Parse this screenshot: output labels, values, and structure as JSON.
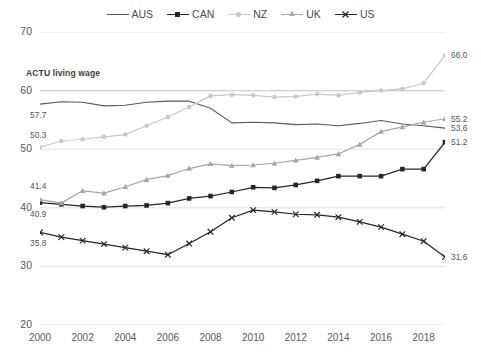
{
  "chart_data": {
    "type": "line",
    "title": "",
    "xlabel": "",
    "ylabel": "",
    "ylim": [
      20,
      70
    ],
    "xlim": [
      2000,
      2019
    ],
    "grid": true,
    "legend_position": "top-center",
    "ytick_labels": [
      "70",
      "60",
      "50",
      "40",
      "30",
      "20"
    ],
    "yticks": [
      70,
      60,
      50,
      40,
      30,
      20
    ],
    "xtick_labels": [
      "2000",
      "2002",
      "2004",
      "2006",
      "2008",
      "2010",
      "2012",
      "2014",
      "2016",
      "2018"
    ],
    "xticks": [
      2000,
      2002,
      2004,
      2006,
      2008,
      2010,
      2012,
      2014,
      2016,
      2018
    ],
    "x": [
      2000,
      2001,
      2002,
      2003,
      2004,
      2005,
      2006,
      2007,
      2008,
      2009,
      2010,
      2011,
      2012,
      2013,
      2014,
      2015,
      2016,
      2017,
      2018,
      2019
    ],
    "series": [
      {
        "name": "AUS",
        "color": "#595959",
        "marker": "none",
        "values": [
          57.7,
          58.1,
          58.0,
          57.4,
          57.5,
          58.0,
          58.2,
          58.2,
          57.0,
          54.5,
          54.6,
          54.5,
          54.2,
          54.3,
          54.0,
          54.4,
          54.9,
          54.3,
          54.0,
          53.6
        ]
      },
      {
        "name": "CAN",
        "color": "#262626",
        "marker": "square",
        "values": [
          40.9,
          40.6,
          40.3,
          40.1,
          40.3,
          40.4,
          40.8,
          41.6,
          42.0,
          42.7,
          43.5,
          43.4,
          43.9,
          44.6,
          45.4,
          45.4,
          45.4,
          46.6,
          46.6,
          51.2
        ]
      },
      {
        "name": "NZ",
        "color": "#c9c9c9",
        "marker": "circle",
        "values": [
          50.3,
          51.4,
          51.7,
          52.1,
          52.5,
          54.0,
          55.5,
          57.2,
          59.1,
          59.3,
          59.2,
          58.9,
          59.0,
          59.4,
          59.2,
          59.7,
          60.0,
          60.3,
          61.3,
          66.0
        ]
      },
      {
        "name": "UK",
        "color": "#a6a6a6",
        "marker": "triangle",
        "values": [
          41.4,
          40.8,
          42.9,
          42.5,
          43.6,
          44.8,
          45.5,
          46.7,
          47.5,
          47.2,
          47.3,
          47.6,
          48.1,
          48.6,
          49.2,
          50.8,
          53.0,
          53.8,
          54.6,
          55.2
        ]
      },
      {
        "name": "US",
        "color": "#262626",
        "marker": "x",
        "values": [
          35.8,
          35.0,
          34.4,
          33.8,
          33.2,
          32.6,
          32.0,
          33.9,
          35.9,
          38.3,
          39.6,
          39.3,
          38.9,
          38.8,
          38.4,
          37.6,
          36.7,
          35.5,
          34.3,
          31.6
        ]
      }
    ],
    "reference_lines": [
      {
        "label": "ACTU living wage",
        "value": 60,
        "color": "#cfcfcf"
      }
    ],
    "start_labels": [
      {
        "series": "AUS",
        "text": "57.7",
        "value": 57.7
      },
      {
        "series": "NZ",
        "text": "50.3",
        "value": 50.3
      },
      {
        "series": "UK",
        "text": "41.4",
        "value": 41.4
      },
      {
        "series": "CAN",
        "text": "40.9",
        "value": 40.9
      },
      {
        "series": "US",
        "text": "35.8",
        "value": 35.8
      }
    ],
    "end_labels": [
      {
        "series": "NZ",
        "text": "66.0",
        "value": 66.0
      },
      {
        "series": "UK",
        "text": "55.2",
        "value": 55.2
      },
      {
        "series": "AUS",
        "text": "53.6",
        "value": 53.6
      },
      {
        "series": "CAN",
        "text": "51.2",
        "value": 51.2
      },
      {
        "series": "US",
        "text": "31.6",
        "value": 31.6
      }
    ]
  },
  "legend": {
    "items": [
      {
        "label": "AUS"
      },
      {
        "label": "CAN"
      },
      {
        "label": "NZ"
      },
      {
        "label": "UK"
      },
      {
        "label": "US"
      }
    ]
  }
}
